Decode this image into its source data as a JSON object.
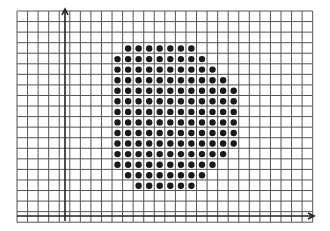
{
  "figure": {
    "grid": {
      "left": 17,
      "top": 11,
      "cell": 10.56,
      "cols": 28,
      "rows": 20,
      "line_color": "#555555",
      "line_width": 1
    },
    "axes": {
      "color": "#222222",
      "y_axis_x": 65,
      "y_axis_top": 9,
      "y_axis_bottom": 221,
      "x_axis_y": 216,
      "x_axis_left": 17,
      "x_axis_right": 314
    },
    "dots": {
      "color": "#1a1a1a",
      "radius": 3.2,
      "col_start_x": 117.5,
      "row_start_y": 48.5,
      "spacing": 10.56,
      "rows": [
        {
          "row": 0,
          "from": 1,
          "to": 7
        },
        {
          "row": 1,
          "from": 0,
          "to": 8
        },
        {
          "row": 2,
          "from": 0,
          "to": 9
        },
        {
          "row": 3,
          "from": 0,
          "to": 10
        },
        {
          "row": 4,
          "from": 0,
          "to": 11
        },
        {
          "row": 5,
          "from": 0,
          "to": 11
        },
        {
          "row": 6,
          "from": 0,
          "to": 11
        },
        {
          "row": 7,
          "from": 0,
          "to": 11
        },
        {
          "row": 8,
          "from": 0,
          "to": 11
        },
        {
          "row": 9,
          "from": 0,
          "to": 11
        },
        {
          "row": 10,
          "from": 0,
          "to": 10
        },
        {
          "row": 11,
          "from": 0,
          "to": 9
        },
        {
          "row": 12,
          "from": 1,
          "to": 8
        },
        {
          "row": 13,
          "from": 2,
          "to": 7
        }
      ],
      "total_count": 146
    }
  }
}
